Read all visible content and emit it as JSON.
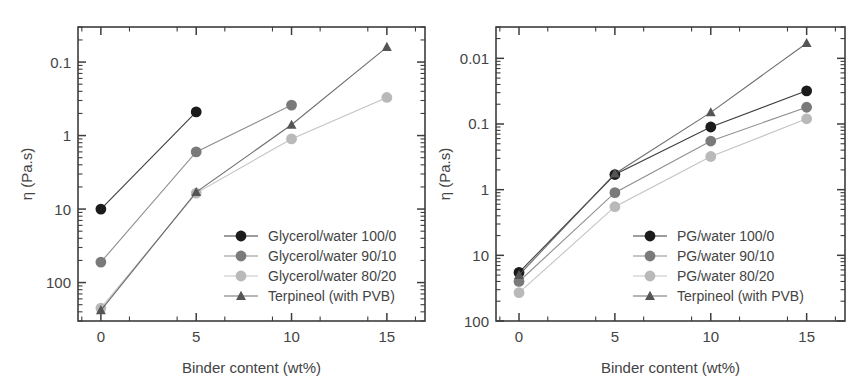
{
  "figure": {
    "panels": [
      {
        "id": "panel-left",
        "name": "glycerol-water-panel",
        "xlabel": "Binder content (wt%)",
        "ylabel": "η (Pa.s)",
        "x_ticks": [
          "0",
          "5",
          "10",
          "15"
        ],
        "y_ticks": [
          "100",
          "10",
          "1",
          "0.1"
        ],
        "legend": [
          {
            "label": "Glycerol/water 100/0",
            "marker": "circle",
            "color": "#1b1b1b"
          },
          {
            "label": "Glycerol/water 90/10",
            "marker": "circle",
            "color": "#7a7a7a"
          },
          {
            "label": "Glycerol/water 80/20",
            "marker": "circle",
            "color": "#b9b9b9"
          },
          {
            "label": "Terpineol (with PVB)",
            "marker": "triangle",
            "color": "#555555"
          }
        ]
      },
      {
        "id": "panel-right",
        "name": "pg-water-panel",
        "xlabel": "Binder content (wt%)",
        "ylabel": "η (Pa.s)",
        "x_ticks": [
          "0",
          "5",
          "10",
          "15"
        ],
        "y_ticks": [
          "100",
          "10",
          "1",
          "0.1",
          "0.01"
        ],
        "legend": [
          {
            "label": "PG/water 100/0",
            "marker": "circle",
            "color": "#1b1b1b"
          },
          {
            "label": "PG/water 90/10",
            "marker": "circle",
            "color": "#7a7a7a"
          },
          {
            "label": "PG/water 80/20",
            "marker": "circle",
            "color": "#b9b9b9"
          },
          {
            "label": "Terpineol (with PVB)",
            "marker": "triangle",
            "color": "#555555"
          }
        ]
      }
    ]
  },
  "chart_data": [
    {
      "type": "line",
      "panel": "left",
      "title": "",
      "xlabel": "Binder content (wt%)",
      "ylabel": "η (Pa.s)",
      "yscale": "log",
      "xlim": [
        -1.2,
        17.0
      ],
      "ylim": [
        0.03,
        300
      ],
      "xticks": [
        0,
        5,
        10,
        15
      ],
      "yticks": [
        0.1,
        1,
        10,
        100
      ],
      "grid": false,
      "legend_position": "lower-right",
      "x": [
        0,
        5,
        10,
        15
      ],
      "series": [
        {
          "name": "Glycerol/water 100/0",
          "marker": "circle",
          "color": "#1b1b1b",
          "x": [
            0,
            5
          ],
          "values": [
            1.0,
            21.0
          ]
        },
        {
          "name": "Glycerol/water 90/10",
          "marker": "circle",
          "color": "#7a7a7a",
          "x": [
            0,
            5,
            10
          ],
          "values": [
            0.19,
            6.0,
            26.0
          ]
        },
        {
          "name": "Glycerol/water 80/20",
          "marker": "circle",
          "color": "#b9b9b9",
          "x": [
            0,
            5,
            10,
            15
          ],
          "values": [
            0.045,
            1.65,
            9.0,
            33.0
          ]
        },
        {
          "name": "Terpineol (with PVB)",
          "marker": "triangle",
          "color": "#555555",
          "x": [
            0,
            5,
            10,
            15
          ],
          "values": [
            0.042,
            1.7,
            14.0,
            160.0
          ]
        }
      ]
    },
    {
      "type": "line",
      "panel": "right",
      "title": "",
      "xlabel": "Binder content (wt%)",
      "ylabel": "η (Pa.s)",
      "yscale": "log",
      "xlim": [
        -1.2,
        17.0
      ],
      "ylim": [
        0.01,
        300
      ],
      "xticks": [
        0,
        5,
        10,
        15
      ],
      "yticks": [
        0.01,
        0.1,
        1,
        10,
        100
      ],
      "grid": false,
      "legend_position": "lower-right",
      "x": [
        0,
        5,
        10,
        15
      ],
      "series": [
        {
          "name": "PG/water 100/0",
          "marker": "circle",
          "color": "#1b1b1b",
          "x": [
            0,
            5,
            10,
            15
          ],
          "values": [
            0.055,
            1.7,
            9.0,
            32.0
          ]
        },
        {
          "name": "PG/water 90/10",
          "marker": "circle",
          "color": "#7a7a7a",
          "x": [
            0,
            5,
            10,
            15
          ],
          "values": [
            0.04,
            0.9,
            5.5,
            18.0
          ]
        },
        {
          "name": "PG/water 80/20",
          "marker": "circle",
          "color": "#b9b9b9",
          "x": [
            0,
            5,
            10,
            15
          ],
          "values": [
            0.027,
            0.55,
            3.2,
            12.0
          ]
        },
        {
          "name": "Terpineol (with PVB)",
          "marker": "triangle",
          "color": "#555555",
          "x": [
            0,
            5,
            10,
            15
          ],
          "values": [
            0.05,
            1.75,
            15.0,
            170.0
          ]
        }
      ]
    }
  ]
}
